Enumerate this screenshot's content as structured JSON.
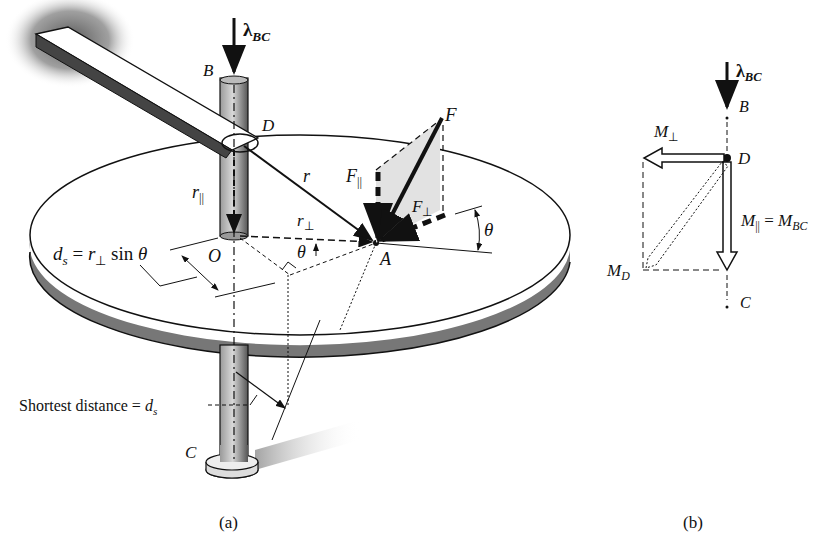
{
  "figure_a": {
    "caption": "(a)",
    "labels": {
      "lambda_bc_sym": "λ",
      "lambda_bc_sub": "BC",
      "point_b": "B",
      "point_d": "D",
      "point_o": "O",
      "point_a": "A",
      "point_c": "C",
      "force_f": "F",
      "r": "r",
      "r_par": "r",
      "r_par_sub": "||",
      "r_perp": "r",
      "r_perp_sub": "⊥",
      "f_par": "F",
      "f_par_sub": "||",
      "f_perp": "F",
      "f_perp_sub": "⊥",
      "theta_1": "θ",
      "theta_2": "θ",
      "ds_lhs": "d",
      "ds_sub": "s",
      "ds_eq": " = ",
      "ds_r": "r",
      "ds_r_sub": "⊥",
      "ds_sin": " sin ",
      "ds_theta": "θ",
      "shortest_text": "Shortest distance = ",
      "shortest_d": "d",
      "shortest_sub": "s"
    }
  },
  "figure_b": {
    "caption": "(b)",
    "labels": {
      "lambda_bc_sym": "λ",
      "lambda_bc_sub": "BC",
      "point_b": "B",
      "point_d": "D",
      "point_c": "C",
      "m_perp": "M",
      "m_perp_sub": "⊥",
      "m_par": "M",
      "m_par_sub": "||",
      "m_par_eq": " = ",
      "m_bc": "M",
      "m_bc_sub": "BC",
      "m_d": "M",
      "m_d_sub": "D"
    }
  }
}
